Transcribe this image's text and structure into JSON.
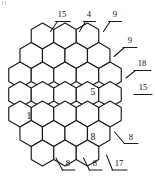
{
  "figure": {
    "type": "patent-line-drawing",
    "stroke_color": "#1a1a1a",
    "fill_color": "#ffffff",
    "background": "#ffffff",
    "width": 155,
    "height": 176
  },
  "reference_labels": [
    {
      "id": "ref-top-15",
      "text": "15",
      "position": "top-left",
      "x": 62,
      "y": 17
    },
    {
      "id": "ref-top-4",
      "text": "4",
      "position": "top-center",
      "x": 89,
      "y": 17
    },
    {
      "id": "ref-top-9",
      "text": "9",
      "position": "top-right",
      "x": 115,
      "y": 17
    },
    {
      "id": "ref-right-9",
      "text": "9",
      "position": "upper-right",
      "x": 130,
      "y": 43
    },
    {
      "id": "ref-right-18",
      "text": "18",
      "position": "middle-right",
      "x": 142,
      "y": 66
    },
    {
      "id": "ref-right-15",
      "text": "15",
      "position": "middle-right-2",
      "x": 143,
      "y": 90
    },
    {
      "id": "ref-right-8",
      "text": "8",
      "position": "lower-right",
      "x": 131,
      "y": 140
    },
    {
      "id": "ref-bottom-8-left",
      "text": "8",
      "position": "bottom-left",
      "x": 68,
      "y": 166
    },
    {
      "id": "ref-bottom-8-mid",
      "text": "8",
      "position": "bottom-center",
      "x": 95,
      "y": 166
    },
    {
      "id": "ref-bottom-17",
      "text": "17",
      "position": "bottom-right",
      "x": 119,
      "y": 166
    }
  ],
  "cell_labels": [
    {
      "id": "cell-1",
      "text": "1",
      "description": "left-middle cell",
      "x": 29,
      "y": 115
    },
    {
      "id": "cell-5",
      "text": "5",
      "description": "upper-right-middle cell",
      "x": 93,
      "y": 91
    },
    {
      "id": "cell-8",
      "text": "8",
      "description": "lower-right cell",
      "x": 93,
      "y": 136
    }
  ],
  "honeycomb": {
    "orientation": "pointy-top",
    "cell_width": 22.5,
    "cell_height": 26,
    "row_pitch": 19.5,
    "rows": [
      {
        "index": 0,
        "count": 3,
        "start_x": 42.5,
        "y": 36
      },
      {
        "index": 1,
        "count": 4,
        "start_x": 31.2,
        "y": 55.5
      },
      {
        "index": 2,
        "count": 5,
        "start_x": 20.0,
        "y": 75
      },
      {
        "index": 3,
        "count": 5,
        "start_x": 20.0,
        "y": 94.5
      },
      {
        "index": 4,
        "count": 5,
        "start_x": 20.0,
        "y": 114
      },
      {
        "index": 5,
        "count": 4,
        "start_x": 31.2,
        "y": 133.5
      },
      {
        "index": 6,
        "count": 3,
        "start_x": 42.5,
        "y": 153
      }
    ]
  }
}
